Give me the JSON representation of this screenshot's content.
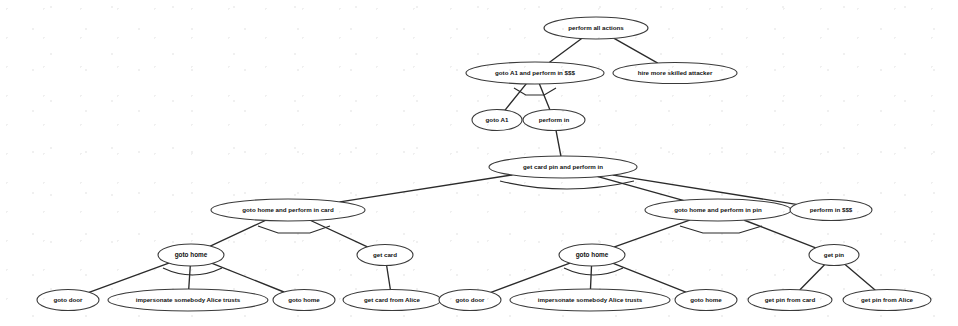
{
  "diagram": {
    "type": "attack-tree",
    "title": "",
    "width": 958,
    "height": 326,
    "background_color": "#ffffff",
    "node_fill_color": "#ffffff",
    "node_stroke_color": "#3a3a3a",
    "edge_color": "#2b2b2b",
    "text_color": "#111111",
    "nodes": [
      {
        "id": "n0",
        "label": "perform all actions",
        "cx": 596,
        "cy": 28,
        "rx": 52,
        "ry": 11,
        "fs": 6.2
      },
      {
        "id": "n1",
        "label": "goto A1 and perform in $$$",
        "cx": 535,
        "cy": 73,
        "rx": 69,
        "ry": 11,
        "fs": 6.2
      },
      {
        "id": "n2",
        "label": "hire more skilled attacker",
        "cx": 675,
        "cy": 73,
        "rx": 62,
        "ry": 10.5,
        "fs": 6.2
      },
      {
        "id": "n3",
        "label": "goto A1",
        "cx": 497,
        "cy": 120,
        "rx": 25,
        "ry": 10.5,
        "fs": 6.2
      },
      {
        "id": "n4",
        "label": "perform in",
        "cx": 554,
        "cy": 120,
        "rx": 31,
        "ry": 10.5,
        "fs": 6.2
      },
      {
        "id": "n5",
        "label": "get card pin and perform in",
        "cx": 563,
        "cy": 167,
        "rx": 74,
        "ry": 11,
        "fs": 6.2
      },
      {
        "id": "n6",
        "label": "goto home and perform in card",
        "cx": 288,
        "cy": 210,
        "rx": 77,
        "ry": 11,
        "fs": 6.2
      },
      {
        "id": "n7",
        "label": "goto home and perform in pin",
        "cx": 718,
        "cy": 210,
        "rx": 73,
        "ry": 11,
        "fs": 6.2
      },
      {
        "id": "n8",
        "label": "perform in $$$",
        "cx": 831,
        "cy": 210,
        "rx": 41,
        "ry": 10.5,
        "fs": 6.2
      },
      {
        "id": "n9",
        "label": "goto home",
        "cx": 191,
        "cy": 255,
        "rx": 33,
        "ry": 11,
        "fs": 6.4
      },
      {
        "id": "n10",
        "label": "get card",
        "cx": 385,
        "cy": 255,
        "rx": 28,
        "ry": 10.5,
        "fs": 6.2
      },
      {
        "id": "n11",
        "label": "goto home",
        "cx": 592,
        "cy": 255,
        "rx": 33,
        "ry": 11,
        "fs": 6.4
      },
      {
        "id": "n12",
        "label": "get pin",
        "cx": 834,
        "cy": 255,
        "rx": 25,
        "ry": 10.5,
        "fs": 6.2
      },
      {
        "id": "n13",
        "label": "goto door",
        "cx": 68,
        "cy": 300,
        "rx": 31,
        "ry": 10.5,
        "fs": 6.2
      },
      {
        "id": "n14",
        "label": "impersonate somebody Alice trusts",
        "cx": 188,
        "cy": 300,
        "rx": 80,
        "ry": 11,
        "fs": 6.2
      },
      {
        "id": "n15",
        "label": "goto home",
        "cx": 304,
        "cy": 300,
        "rx": 31,
        "ry": 10.5,
        "fs": 6.2
      },
      {
        "id": "n16",
        "label": "get card from Alice",
        "cx": 392,
        "cy": 300,
        "rx": 49,
        "ry": 10.5,
        "fs": 6.2
      },
      {
        "id": "n17",
        "label": "goto door",
        "cx": 470,
        "cy": 300,
        "rx": 31,
        "ry": 10.5,
        "fs": 6.2
      },
      {
        "id": "n18",
        "label": "impersonate somebody Alice trusts",
        "cx": 590,
        "cy": 300,
        "rx": 80,
        "ry": 11,
        "fs": 6.2
      },
      {
        "id": "n19",
        "label": "goto home",
        "cx": 706,
        "cy": 300,
        "rx": 31,
        "ry": 10.5,
        "fs": 6.2
      },
      {
        "id": "n20",
        "label": "get pin from card",
        "cx": 790,
        "cy": 300,
        "rx": 42,
        "ry": 10.5,
        "fs": 6.2
      },
      {
        "id": "n21",
        "label": "get pin from Alice",
        "cx": 887,
        "cy": 300,
        "rx": 44,
        "ry": 10.5,
        "fs": 6.2
      }
    ],
    "edges": [
      {
        "from": "n0",
        "to": "n1"
      },
      {
        "from": "n0",
        "to": "n2"
      },
      {
        "from": "n1",
        "to": "n3"
      },
      {
        "from": "n1",
        "to": "n4"
      },
      {
        "from": "n4",
        "to": "n5"
      },
      {
        "from": "n5",
        "to": "n6"
      },
      {
        "from": "n5",
        "to": "n7"
      },
      {
        "from": "n5",
        "to": "n8"
      },
      {
        "from": "n6",
        "to": "n9"
      },
      {
        "from": "n6",
        "to": "n10"
      },
      {
        "from": "n7",
        "to": "n11"
      },
      {
        "from": "n7",
        "to": "n12"
      },
      {
        "from": "n9",
        "to": "n13"
      },
      {
        "from": "n9",
        "to": "n14"
      },
      {
        "from": "n9",
        "to": "n15"
      },
      {
        "from": "n10",
        "to": "n16"
      },
      {
        "from": "n11",
        "to": "n17"
      },
      {
        "from": "n11",
        "to": "n18"
      },
      {
        "from": "n11",
        "to": "n19"
      },
      {
        "from": "n12",
        "to": "n20"
      },
      {
        "from": "n12",
        "to": "n21"
      }
    ],
    "connectors": [
      {
        "parent": "n1",
        "kind": "and-arc",
        "x1": 514,
        "x2": 556,
        "y": 88,
        "depth": 7
      },
      {
        "parent": "n6",
        "kind": "and-arc",
        "x1": 258,
        "x2": 330,
        "y": 226,
        "depth": 7
      },
      {
        "parent": "n7",
        "kind": "and-arc",
        "x1": 680,
        "x2": 762,
        "y": 226,
        "depth": 7
      },
      {
        "parent": "n5",
        "kind": "or-arc",
        "x1": 500,
        "x2": 634,
        "y": 181,
        "depth": 8
      },
      {
        "parent": "n9",
        "kind": "or-arc",
        "x1": 163,
        "x2": 222,
        "y": 268,
        "depth": 7
      },
      {
        "parent": "n11",
        "kind": "or-arc",
        "x1": 564,
        "x2": 623,
        "y": 268,
        "depth": 7
      }
    ]
  }
}
